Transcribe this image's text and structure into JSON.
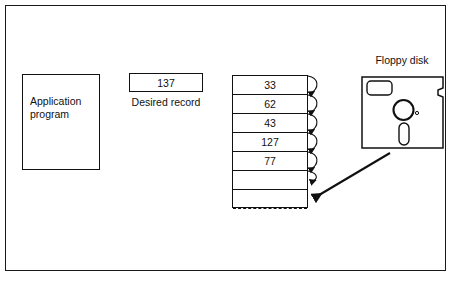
{
  "figure": {
    "title": "",
    "type": "diagram"
  },
  "application_box": {
    "label_line1": "Application",
    "label_line2": "program",
    "label": "Application program"
  },
  "desired_record": {
    "value": "137",
    "caption": "Desired record"
  },
  "buffer_table": {
    "rows": [
      {
        "value": "33",
        "has_arrow": true
      },
      {
        "value": "62",
        "has_arrow": true
      },
      {
        "value": "43",
        "has_arrow": true
      },
      {
        "value": "127",
        "has_arrow": true
      },
      {
        "value": "77",
        "has_arrow": true
      },
      {
        "value": "",
        "has_arrow": true
      },
      {
        "value": "",
        "has_arrow": false,
        "separator": "dashed"
      },
      {
        "value": "",
        "has_arrow": false
      }
    ]
  },
  "floppy_disk": {
    "label": "Floppy disk",
    "parts": {
      "shutter_label": "label-area",
      "hub": "hub-circle",
      "index_hole": "index-hole-dot",
      "drive_slot": "oval-slot",
      "write_notch": "write-protect-notch"
    }
  },
  "connectors": {
    "scan_arrows_count": 6,
    "load_arrow": "floppy-to-buffer"
  },
  "colors": {
    "ink": "#111111",
    "frame": "#1a1a1a",
    "background": "#ffffff"
  }
}
